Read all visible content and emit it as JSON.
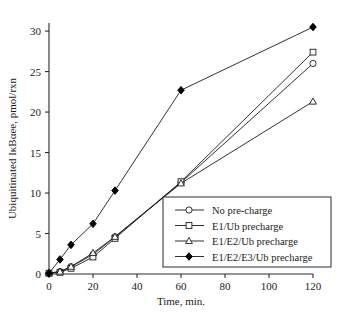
{
  "chart_data": {
    "type": "line",
    "title": "",
    "xlabel": "Time, min.",
    "ylabel": "Ubiquitinated IκBαee, pmol/rxn",
    "xlim": [
      0,
      120
    ],
    "ylim": [
      0,
      31
    ],
    "xticks": [
      0,
      20,
      40,
      60,
      80,
      100,
      120
    ],
    "yticks": [
      0,
      5,
      10,
      15,
      20,
      25,
      30
    ],
    "xtick_labels": [
      "0",
      "20",
      "40",
      "60",
      "80",
      "100",
      "120"
    ],
    "ytick_labels": [
      "0",
      "5",
      "10",
      "15",
      "20",
      "25",
      "30"
    ],
    "grid": false,
    "legend_position": "inside-lower-right",
    "series": [
      {
        "name": "No pre-charge",
        "marker": "open-circle",
        "x": [
          0,
          5,
          10,
          20,
          30,
          60,
          120
        ],
        "values": [
          0.1,
          0.3,
          0.9,
          2.4,
          4.6,
          11.3,
          26.0
        ]
      },
      {
        "name": "E1/Ub precharge",
        "marker": "open-square",
        "x": [
          0,
          5,
          10,
          20,
          30,
          60,
          120
        ],
        "values": [
          0.1,
          0.2,
          0.7,
          2.1,
          4.4,
          11.4,
          27.4
        ]
      },
      {
        "name": "E1/E2/Ub precharge",
        "marker": "open-triangle",
        "x": [
          0,
          5,
          10,
          20,
          30,
          60,
          120
        ],
        "values": [
          0.1,
          0.3,
          0.9,
          2.6,
          4.6,
          11.2,
          21.3
        ]
      },
      {
        "name": "E1/E2/E3/Ub precharge",
        "marker": "filled-diamond",
        "x": [
          0,
          5,
          10,
          20,
          30,
          60,
          120
        ],
        "values": [
          0.1,
          1.8,
          3.6,
          6.2,
          10.3,
          22.7,
          30.5
        ]
      }
    ]
  },
  "legend": {
    "entries": [
      {
        "label": "No pre-charge",
        "marker": "open-circle"
      },
      {
        "label": "E1/Ub precharge",
        "marker": "open-square"
      },
      {
        "label": "E1/E2/Ub precharge",
        "marker": "open-triangle"
      },
      {
        "label": "E1/E2/E3/Ub precharge",
        "marker": "filled-diamond"
      }
    ]
  },
  "colors": {
    "line": "#1a1a1a",
    "axis": "#2b2b2b",
    "marker_fill_open": "#ffffff",
    "marker_fill_closed": "#000000",
    "background": "#ffffff"
  }
}
